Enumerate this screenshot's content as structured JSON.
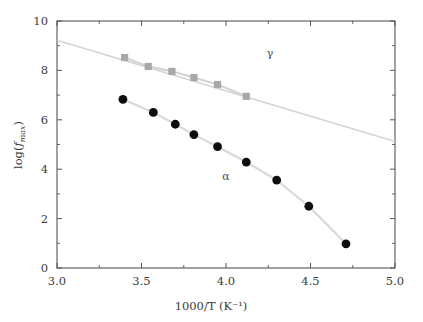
{
  "chart_data": {
    "type": "scatter",
    "title": "",
    "xlabel": "1000/T (K⁻¹)",
    "ylabel": "log(f_max)",
    "ylabel_parts": {
      "prefix": "log(",
      "italic": "f",
      "subscript": "max",
      "suffix": ")"
    },
    "xlim": [
      3.0,
      5.0
    ],
    "ylim": [
      0,
      10
    ],
    "xticks": [
      3.0,
      3.5,
      4.0,
      4.5,
      5.0
    ],
    "xtick_labels": [
      "3.0",
      "3.5",
      "4.0",
      "4.5",
      "5.0"
    ],
    "xminor_ticks": [
      3.25,
      3.75,
      4.25,
      4.75
    ],
    "yticks": [
      0,
      2,
      4,
      6,
      8,
      10
    ],
    "ytick_labels": [
      "0",
      "2",
      "4",
      "6",
      "8",
      "10"
    ],
    "yminor_ticks": [
      1,
      3,
      5,
      7,
      9
    ],
    "grid": false,
    "legend_position": "inline-annotation",
    "series": [
      {
        "name": "γ",
        "marker": "square",
        "color": "#a8a8a8",
        "line_color": "#d4d4d4",
        "annotation": "γ",
        "annotation_x": 4.26,
        "annotation_y": 8.53,
        "x": [
          3.4,
          3.54,
          3.68,
          3.81,
          3.95,
          4.12
        ],
        "y": [
          8.52,
          8.16,
          7.96,
          7.71,
          7.43,
          6.95
        ],
        "fit_line": {
          "x0": 3.0,
          "y0": 9.22,
          "x1": 5.0,
          "y1": 5.12
        }
      },
      {
        "name": "α",
        "marker": "circle",
        "color": "#0d0d0d",
        "line_color": "#d9d9d9",
        "annotation": "α",
        "annotation_x": 4.0,
        "annotation_y": 3.58,
        "x": [
          3.39,
          3.57,
          3.7,
          3.81,
          3.95,
          4.12,
          4.3,
          4.49,
          4.71
        ],
        "y": [
          6.83,
          6.3,
          5.82,
          5.4,
          4.91,
          4.29,
          3.56,
          2.5,
          0.98
        ],
        "fit_line": null
      }
    ]
  },
  "axes": {
    "frame_color": "#555555",
    "background": "#ffffff"
  }
}
